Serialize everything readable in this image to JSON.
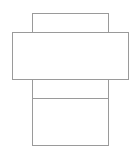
{
  "diagram": {
    "title": "",
    "type": "box-net",
    "stroke_color": "#9a9a9a",
    "background": "#ffffff",
    "faces": [
      {
        "name": "top-flap",
        "x": 32,
        "y": 13,
        "w": 77,
        "h": 20
      },
      {
        "name": "wide-face",
        "x": 12,
        "y": 32,
        "w": 117,
        "h": 48
      },
      {
        "name": "middle-band",
        "x": 32,
        "y": 79,
        "w": 77,
        "h": 20
      },
      {
        "name": "bottom-face",
        "x": 32,
        "y": 98,
        "w": 77,
        "h": 48
      }
    ]
  }
}
